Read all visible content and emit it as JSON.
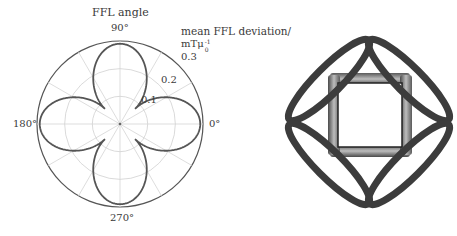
{
  "chart_data": {
    "type": "polar-line",
    "title": "FFL angle",
    "radial_axis_label": "mean FFL deviation/",
    "radial_axis_unit": "mTμ0^-1",
    "angle_tick_labels": [
      "0°",
      "90°",
      "180°",
      "270°"
    ],
    "angle_gridlines_deg": [
      0,
      30,
      60,
      90,
      120,
      150,
      180,
      210,
      240,
      270,
      300,
      330
    ],
    "radial_ticks": [
      0.1,
      0.2,
      0.3
    ],
    "radial_tick_labels": [
      "0.1",
      "0.2",
      "0.3"
    ],
    "rlim": [
      0,
      0.3
    ],
    "grid": true,
    "series": [
      {
        "name": "mean FFL deviation",
        "theta_deg": [
          0,
          15,
          30,
          45,
          60,
          75,
          90,
          105,
          120,
          135,
          150,
          165,
          180,
          195,
          210,
          225,
          240,
          255,
          270,
          285,
          300,
          315,
          330,
          345
        ],
        "r": [
          0.29,
          0.26,
          0.17,
          0.077,
          0.17,
          0.26,
          0.29,
          0.26,
          0.17,
          0.077,
          0.17,
          0.26,
          0.29,
          0.26,
          0.17,
          0.077,
          0.17,
          0.26,
          0.29,
          0.26,
          0.17,
          0.077,
          0.17,
          0.26
        ],
        "color": "#555555"
      }
    ],
    "model": {
      "r_min": 0.077,
      "r_max": 0.29,
      "symmetry": "four-fold, maxima at 0/90/180/270°"
    }
  },
  "labels": {
    "title": "FFL angle",
    "angle_0": "0°",
    "angle_90": "90°",
    "angle_180": "180°",
    "angle_270": "270°",
    "radial_axis_label": "mean FFL deviation/",
    "unit_main": "mTμ",
    "unit_sup": "-1",
    "unit_sub": "0",
    "r1": "0.1",
    "r2": "0.2",
    "r3": "0.3"
  },
  "figure": {
    "outer_coil_color": "#3c3c3c",
    "inner_coil_color": "#8a8a8a"
  }
}
